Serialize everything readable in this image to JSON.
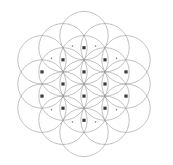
{
  "figure": {
    "type": "geometric-construction",
    "background_color": "#ffffff",
    "width": 173,
    "height": 165
  },
  "geometry": {
    "center": {
      "x": 84.0,
      "y": 84.0
    },
    "circle_radius": 24.2,
    "circle_count": 19,
    "lattice": {
      "type": "hexagonal",
      "h_step": 21.0,
      "v_step": 12.1,
      "rings": 2
    },
    "stroke": {
      "color": "#8f8f8f",
      "width": 0.55
    },
    "circles": [
      {
        "cx": 84.0,
        "cy": 84.0,
        "ring": 0,
        "index": 0
      },
      {
        "cx": 105.0,
        "cy": 71.9,
        "ring": 1,
        "index": 1
      },
      {
        "cx": 105.0,
        "cy": 96.1,
        "ring": 1,
        "index": 2
      },
      {
        "cx": 84.0,
        "cy": 108.2,
        "ring": 1,
        "index": 3
      },
      {
        "cx": 63.0,
        "cy": 96.1,
        "ring": 1,
        "index": 4
      },
      {
        "cx": 63.0,
        "cy": 71.9,
        "ring": 1,
        "index": 5
      },
      {
        "cx": 84.0,
        "cy": 59.8,
        "ring": 1,
        "index": 6
      },
      {
        "cx": 126.0,
        "cy": 59.8,
        "ring": 2,
        "index": 7
      },
      {
        "cx": 126.0,
        "cy": 84.0,
        "ring": 2,
        "index": 8
      },
      {
        "cx": 126.0,
        "cy": 108.2,
        "ring": 2,
        "index": 9
      },
      {
        "cx": 105.0,
        "cy": 120.3,
        "ring": 2,
        "index": 10
      },
      {
        "cx": 84.0,
        "cy": 132.4,
        "ring": 2,
        "index": 11
      },
      {
        "cx": 63.0,
        "cy": 120.3,
        "ring": 2,
        "index": 12
      },
      {
        "cx": 42.0,
        "cy": 108.2,
        "ring": 2,
        "index": 13
      },
      {
        "cx": 42.0,
        "cy": 84.0,
        "ring": 2,
        "index": 14
      },
      {
        "cx": 42.0,
        "cy": 59.8,
        "ring": 2,
        "index": 15
      },
      {
        "cx": 63.0,
        "cy": 47.7,
        "ring": 2,
        "index": 16
      },
      {
        "cx": 84.0,
        "cy": 35.6,
        "ring": 2,
        "index": 17
      },
      {
        "cx": 105.0,
        "cy": 47.7,
        "ring": 2,
        "index": 18
      }
    ],
    "vertices": [
      {
        "x": 84.0,
        "y": 47.7,
        "size": 3.2,
        "color": "#3a3a3a"
      },
      {
        "x": 63.0,
        "y": 59.8,
        "size": 3.2,
        "color": "#3a3a3a"
      },
      {
        "x": 105.0,
        "y": 59.8,
        "size": 3.2,
        "color": "#3a3a3a"
      },
      {
        "x": 42.0,
        "y": 71.9,
        "size": 3.2,
        "color": "#3a3a3a"
      },
      {
        "x": 84.0,
        "y": 71.9,
        "size": 3.2,
        "color": "#3a3a3a"
      },
      {
        "x": 126.0,
        "y": 71.9,
        "size": 3.2,
        "color": "#3a3a3a"
      },
      {
        "x": 63.0,
        "y": 84.0,
        "size": 3.2,
        "color": "#3a3a3a"
      },
      {
        "x": 105.0,
        "y": 84.0,
        "size": 3.2,
        "color": "#3a3a3a"
      },
      {
        "x": 42.0,
        "y": 96.1,
        "size": 3.2,
        "color": "#3a3a3a"
      },
      {
        "x": 84.0,
        "y": 96.1,
        "size": 3.2,
        "color": "#3a3a3a"
      },
      {
        "x": 126.0,
        "y": 96.1,
        "size": 3.2,
        "color": "#3a3a3a"
      },
      {
        "x": 63.0,
        "y": 108.2,
        "size": 3.2,
        "color": "#3a3a3a"
      },
      {
        "x": 105.0,
        "y": 108.2,
        "size": 3.2,
        "color": "#3a3a3a"
      },
      {
        "x": 84.0,
        "y": 120.3,
        "size": 3.2,
        "color": "#3a3a3a"
      }
    ],
    "minor_vertices": [
      {
        "x": 72.5,
        "y": 46.0,
        "size": 1.3,
        "color": "#6e6e6e"
      },
      {
        "x": 95.5,
        "y": 46.0,
        "size": 1.3,
        "color": "#6e6e6e"
      },
      {
        "x": 51.5,
        "y": 58.2,
        "size": 1.3,
        "color": "#6e6e6e"
      },
      {
        "x": 116.5,
        "y": 58.2,
        "size": 1.3,
        "color": "#6e6e6e"
      },
      {
        "x": 51.5,
        "y": 109.8,
        "size": 1.3,
        "color": "#6e6e6e"
      },
      {
        "x": 116.5,
        "y": 109.8,
        "size": 1.3,
        "color": "#6e6e6e"
      },
      {
        "x": 72.5,
        "y": 122.0,
        "size": 1.3,
        "color": "#6e6e6e"
      },
      {
        "x": 95.5,
        "y": 122.0,
        "size": 1.3,
        "color": "#6e6e6e"
      }
    ]
  }
}
